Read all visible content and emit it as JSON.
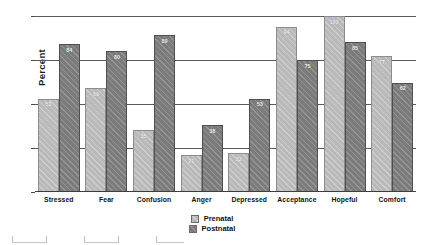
{
  "chart_data": {
    "type": "bar",
    "title": "",
    "xlabel": "",
    "ylabel": "Percent",
    "ylim": [
      0,
      100
    ],
    "yticks": [
      0,
      25,
      50,
      75,
      100
    ],
    "ytick_labels": [
      "0",
      "25",
      "50",
      "75",
      "100"
    ],
    "grid": true,
    "legend_position": "bottom",
    "categories": [
      "Stressed",
      "Fear",
      "Confusion",
      "Anger",
      "Depressed",
      "Acceptance",
      "Hopeful",
      "Comfort"
    ],
    "series": [
      {
        "name": "Prenatal",
        "color": "#b9b9b9",
        "values": [
          53,
          59,
          35,
          21,
          22,
          94,
          100,
          77
        ]
      },
      {
        "name": "Postnatal",
        "color": "#7b7b7b",
        "values": [
          84,
          80,
          89,
          38,
          53,
          75,
          85,
          62
        ]
      }
    ]
  },
  "legend": {
    "items": [
      {
        "label": "Prenatal",
        "swatch": "prenatal-swatch"
      },
      {
        "label": "Postnatal",
        "swatch": "postnatal-swatch"
      }
    ]
  }
}
